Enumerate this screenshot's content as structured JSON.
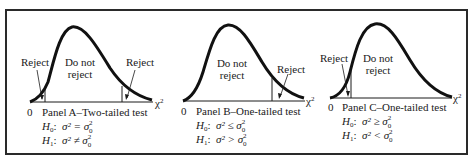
{
  "panels": [
    {
      "id": "A",
      "title": "Panel A–Two-tailed test",
      "origin_label": "0",
      "axis_label": "χ",
      "axis_label_sup": "2",
      "region_do_not": "Do not",
      "region_reject_word": "reject",
      "reject_labels": [
        "Reject",
        "Reject"
      ],
      "h0_prefix": "H",
      "h0_sub": "0",
      "h0_relation": "σ² = σ",
      "h1_prefix": "H",
      "h1_sub": "1",
      "h1_relation": "σ² ≠ σ",
      "sigma0_sup": "2",
      "sigma0_sub": "0"
    },
    {
      "id": "B",
      "title": "Panel B–One-tailed test",
      "origin_label": "0",
      "axis_label": "χ",
      "axis_label_sup": "2",
      "region_do_not": "Do not",
      "region_reject_word": "reject",
      "reject_labels": [
        "Reject"
      ],
      "h0_prefix": "H",
      "h0_sub": "0",
      "h0_relation": "σ² ≤ σ",
      "h1_prefix": "H",
      "h1_sub": "1",
      "h1_relation": "σ² > σ",
      "sigma0_sup": "2",
      "sigma0_sub": "0"
    },
    {
      "id": "C",
      "title": "Panel C–One-tailed test",
      "origin_label": "0",
      "axis_label": "χ",
      "axis_label_sup": "2",
      "region_do_not": "Do not",
      "region_reject_word": "reject",
      "reject_labels": [
        "Reject"
      ],
      "h0_prefix": "H",
      "h0_sub": "0",
      "h0_relation": "σ² ≥ σ",
      "h1_prefix": "H",
      "h1_sub": "1",
      "h1_relation": "σ² < σ",
      "sigma0_sup": "2",
      "sigma0_sub": "0"
    }
  ],
  "colors": {
    "ink": "#1a1a1a",
    "frame": "#2a2a2a",
    "background": "#ffffff"
  }
}
